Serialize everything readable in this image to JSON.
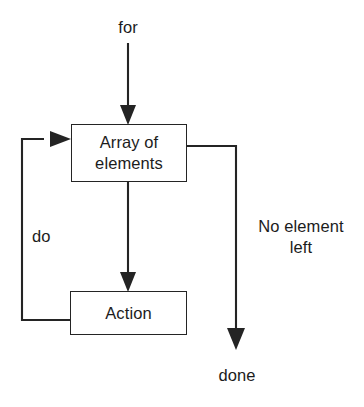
{
  "diagram": {
    "type": "flowchart",
    "canvas": {
      "width": 364,
      "height": 407
    },
    "style": {
      "background_color": "#ffffff",
      "line_color": "#242424",
      "text_color": "#1c1c1c",
      "box_fill": "#ffffff"
    },
    "nodes": [
      {
        "id": "array-of-elements",
        "label": "Array of\nelements",
        "shape": "rectangle",
        "x": 71,
        "y": 124,
        "width": 116,
        "height": 58
      },
      {
        "id": "action",
        "label": "Action",
        "shape": "rectangle",
        "x": 70,
        "y": 291,
        "width": 117,
        "height": 44
      }
    ],
    "edge_labels": [
      {
        "id": "for",
        "text": "for",
        "align": "center"
      },
      {
        "id": "do",
        "text": "do",
        "align": "left"
      },
      {
        "id": "no-element-left",
        "text": "No element\nleft",
        "align": "center"
      },
      {
        "id": "done",
        "text": "done",
        "align": "center"
      }
    ],
    "edges": [
      {
        "id": "entry-edge",
        "from": "for",
        "to": "array-of-elements",
        "direction": "down",
        "arrow": true
      },
      {
        "id": "iterate-edge",
        "from": "array-of-elements",
        "to": "action",
        "direction": "down",
        "arrow": true,
        "label": "do"
      },
      {
        "id": "loop-back-edge",
        "from": "action",
        "to": "array-of-elements",
        "direction": "left-up-right",
        "arrow": true
      },
      {
        "id": "exit-edge",
        "from": "array-of-elements",
        "to": "done",
        "direction": "right-down",
        "arrow": true,
        "label": "No element left"
      }
    ]
  }
}
